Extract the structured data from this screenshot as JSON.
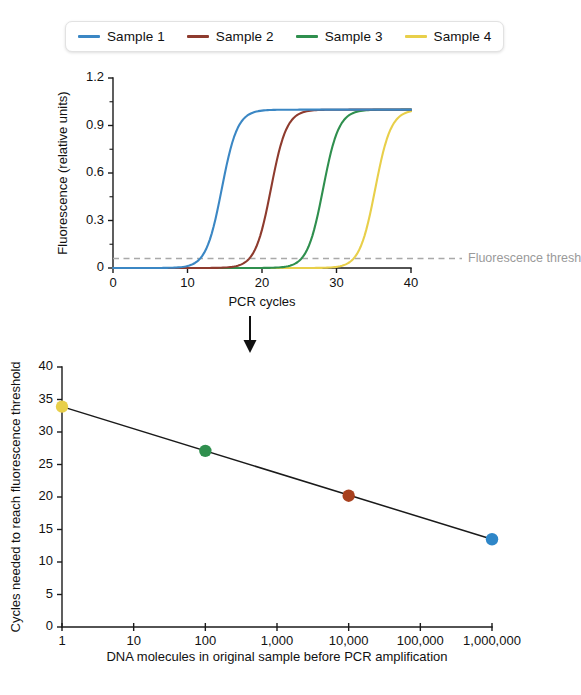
{
  "legend": {
    "items": [
      {
        "label": "Sample 1",
        "color": "#3b87c4"
      },
      {
        "label": "Sample 2",
        "color": "#8e3b2e"
      },
      {
        "label": "Sample 3",
        "color": "#2f8f4e"
      },
      {
        "label": "Sample 4",
        "color": "#e8cf4a"
      }
    ]
  },
  "flow": {
    "arrow_icon": "down-arrow-icon"
  },
  "chart_data": [
    {
      "type": "line",
      "id": "amplification-curves",
      "title": "",
      "xlabel": "PCR cycles",
      "ylabel": "Fluorescence (relative units)",
      "xlim": [
        0,
        40
      ],
      "ylim": [
        0,
        1.2
      ],
      "xticks": [
        0,
        10,
        20,
        30,
        40
      ],
      "xticklabels": [
        "0",
        "10",
        "20",
        "30",
        "40"
      ],
      "yticks": [
        0,
        0.3,
        0.6,
        0.9,
        1.2
      ],
      "yticklabels": [
        "0",
        "0.3",
        "0.6",
        "0.9",
        "1.2"
      ],
      "yminorticks": [
        0.15,
        0.45,
        0.75,
        1.05
      ],
      "grid": false,
      "legend_position": "above-plot",
      "annotations": [
        {
          "name": "fluorescence-threshold",
          "text": "Fluorescence threshold",
          "y": 0.06,
          "style": "dashed-horizontal-line",
          "color": "#a9a9a9"
        }
      ],
      "series": [
        {
          "name": "Sample 1",
          "color": "#3b87c4",
          "plateau": 1.0,
          "midpoint_cycle": 14.6,
          "steepness": 0.95,
          "threshold_cycle": 13.5
        },
        {
          "name": "Sample 2",
          "color": "#8e3b2e",
          "plateau": 1.0,
          "midpoint_cycle": 21.2,
          "steepness": 0.95,
          "threshold_cycle": 20.1
        },
        {
          "name": "Sample 3",
          "color": "#2f8f4e",
          "plateau": 1.0,
          "midpoint_cycle": 28.2,
          "steepness": 0.95,
          "threshold_cycle": 27.1
        },
        {
          "name": "Sample 4",
          "color": "#e8cf4a",
          "plateau": 1.0,
          "midpoint_cycle": 35.2,
          "steepness": 0.95,
          "threshold_cycle": 34.0
        }
      ]
    },
    {
      "type": "scatter",
      "id": "standard-curve",
      "title": "",
      "xlabel": "DNA molecules in original sample before PCR amplification",
      "ylabel": "Cycles needed to reach fluorescence threshold",
      "xscale": "log10",
      "xlim": [
        1,
        1000000
      ],
      "ylim": [
        0,
        40
      ],
      "xticks": [
        1,
        10,
        100,
        1000,
        10000,
        100000,
        1000000
      ],
      "xticklabels": [
        "1",
        "10",
        "100",
        "1,000",
        "10,000",
        "100,000",
        "1,000,000"
      ],
      "yticks": [
        0,
        5,
        10,
        15,
        20,
        25,
        30,
        35,
        40
      ],
      "yticklabels": [
        "0",
        "5",
        "10",
        "15",
        "20",
        "25",
        "30",
        "35",
        "40"
      ],
      "grid": false,
      "fit_line": {
        "name": "standard-curve-fit",
        "color": "#1a1a1a",
        "x_start": 1,
        "y_start": 33.9,
        "x_end": 1000000,
        "y_end": 13.5
      },
      "points": [
        {
          "name": "Sample 4",
          "x": 1,
          "y": 33.9,
          "color": "#e8cf4a"
        },
        {
          "name": "Sample 3",
          "x": 100,
          "y": 27.1,
          "color": "#2f8f4e"
        },
        {
          "name": "Sample 2",
          "x": 10000,
          "y": 20.2,
          "color": "#a8401e"
        },
        {
          "name": "Sample 1",
          "x": 1000000,
          "y": 13.5,
          "color": "#2e86c8"
        }
      ]
    }
  ]
}
